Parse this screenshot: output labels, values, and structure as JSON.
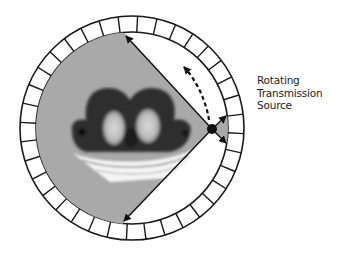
{
  "diagram": {
    "label_lines": [
      "Rotating",
      "Transmission",
      "Source"
    ],
    "detector_ring": {
      "segments": 36
    },
    "colors": {
      "background": "#ffffff",
      "field_of_view": "#a9a9a9",
      "ring_stroke": "#1a1a1a",
      "ring_fill": "#ffffff",
      "source": "#111111",
      "arrow": "#111111"
    }
  }
}
